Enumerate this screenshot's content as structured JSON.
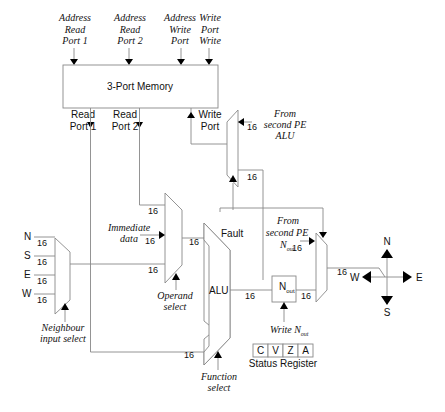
{
  "diagram": {
    "memory": {
      "label": "3-Port Memory",
      "inputs": [
        {
          "l1": "Address",
          "l2": "Read",
          "l3": "Port 1"
        },
        {
          "l1": "Address",
          "l2": "Read",
          "l3": "Port 2"
        },
        {
          "l1": "Address",
          "l2": "Write",
          "l3": "Port"
        },
        {
          "l1": "Write",
          "l2": "Port",
          "l3": "Write"
        }
      ],
      "read_port_1": {
        "l1": "Read",
        "l2": "Port 1"
      },
      "read_port_2": {
        "l1": "Read",
        "l2": "Port 2"
      },
      "write_port": {
        "l1": "Write",
        "l2": "Port"
      }
    },
    "from_second_alu": {
      "l1": "From",
      "l2": "second PE",
      "l3": "ALU"
    },
    "from_second_nout": {
      "l1": "From",
      "l2": "second PE",
      "l3": "N"
    },
    "nout_sub": "out",
    "immediate": {
      "l1": "Immediate",
      "l2": "data"
    },
    "operand_select": {
      "l1": "Operand",
      "l2": "select"
    },
    "neighbour_select": {
      "l1": "Neighbour",
      "l2": "input select"
    },
    "function_select": {
      "l1": "Function",
      "l2": "select"
    },
    "write_nout": {
      "main": "Write N",
      "sub": "out"
    },
    "alu_label": "ALU",
    "fault_label": "Fault",
    "nout_label": "N",
    "bus_width": "16",
    "neighbour_inputs": [
      "N",
      "S",
      "E",
      "W"
    ],
    "status_register": {
      "label": "Status Register",
      "flags": [
        "C",
        "V",
        "Z",
        "A"
      ]
    },
    "compass": {
      "n": "N",
      "s": "S",
      "e": "E",
      "w": "W"
    }
  }
}
